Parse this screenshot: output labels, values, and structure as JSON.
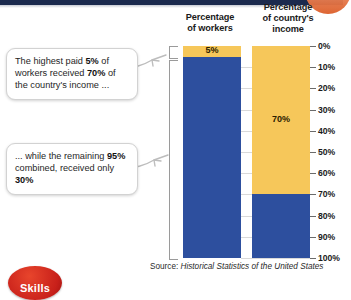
{
  "figure": {
    "headers": {
      "workers": "Percentage\nof workers",
      "income": "Percentage\nof country's\nincome"
    },
    "callouts": [
      {
        "id": "callout-top",
        "text_parts": [
          "The highest paid ",
          "5%",
          " of workers received ",
          "70%",
          " of the country's income ..."
        ],
        "plain": "The highest paid 5% of workers received 70% of the country's income ..."
      },
      {
        "id": "callout-bottom",
        "text_parts": [
          "... while the remaining ",
          "95%",
          " combined, received only ",
          "30%"
        ],
        "plain": "... while the remaining 95% combined, received only 30%"
      }
    ],
    "source_prefix": "Source: ",
    "source_title": "Historical Statistics of the United States",
    "badge_label": "Skills"
  },
  "colors": {
    "gold": "#f6c75a",
    "blue": "#2d4f9e",
    "top_band": "#1b2a4e",
    "accent_orange": "#e8622a",
    "badge_red": "#c8201a",
    "gridline": "#d9d9d9"
  },
  "chart_data": {
    "type": "bar",
    "title": "",
    "subtitle": "",
    "xlabel": "",
    "ylabel": "",
    "ylim": [
      0,
      100
    ],
    "y_inverted": true,
    "grid": true,
    "legend_position": "none",
    "tick_labels": [
      "0%",
      "10%",
      "20%",
      "30%",
      "40%",
      "50%",
      "60%",
      "70%",
      "80%",
      "90%",
      "100%"
    ],
    "tick_values": [
      0,
      10,
      20,
      30,
      40,
      50,
      60,
      70,
      80,
      90,
      100
    ],
    "categories": [
      "Percentage of workers",
      "Percentage of country's income"
    ],
    "series": [
      {
        "name": "Top earners (gold)",
        "values": [
          5,
          70
        ],
        "color": "#f6c75a",
        "data_labels": [
          "5%",
          "70%"
        ]
      },
      {
        "name": "Remaining (blue)",
        "values": [
          95,
          30
        ],
        "color": "#2d4f9e",
        "data_labels": [
          "",
          ""
        ]
      }
    ],
    "annotations": [
      "The highest paid 5% of workers received 70% of the country's income ...",
      "... while the remaining 95% combined, received only 30%"
    ],
    "source": "Source: Historical Statistics of the United States"
  }
}
